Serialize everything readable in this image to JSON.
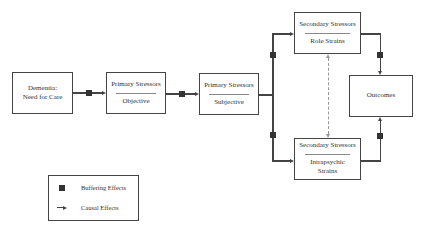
{
  "nodes": {
    "dementia": {
      "line1": "Dementia:",
      "line2": "Need for Care"
    },
    "primary_objective": {
      "title": "Primary Stressors",
      "subtitle": "Objective"
    },
    "primary_subjective": {
      "title": "Primary Stressors",
      "subtitle": "Subjective"
    },
    "secondary_role": {
      "title": "Secondary Stressors",
      "subtitle": "Role Strains"
    },
    "secondary_intrapsychic": {
      "title": "Secondary Stressors",
      "subtitle_line1": "Intrapsychic",
      "subtitle_line2": "Strains"
    },
    "outcomes": {
      "label": "Outcomes"
    }
  },
  "edges": [
    {
      "from": "dementia",
      "to": "primary_objective",
      "type": "causal",
      "buffered": true
    },
    {
      "from": "primary_objective",
      "to": "primary_subjective",
      "type": "causal",
      "buffered": true
    },
    {
      "from": "primary_subjective",
      "to": "secondary_role",
      "type": "causal",
      "buffered": true
    },
    {
      "from": "primary_subjective",
      "to": "secondary_intrapsychic",
      "type": "causal",
      "buffered": true
    },
    {
      "from": "secondary_role",
      "to": "outcomes",
      "type": "causal",
      "buffered": true
    },
    {
      "from": "secondary_intrapsychic",
      "to": "outcomes",
      "type": "causal",
      "buffered": true
    },
    {
      "from": "secondary_role",
      "to": "secondary_intrapsychic",
      "type": "bidirectional-dashed",
      "buffered": false
    }
  ],
  "legend": {
    "buffering": "Buffering Effects",
    "causal": "Causal Effects"
  }
}
